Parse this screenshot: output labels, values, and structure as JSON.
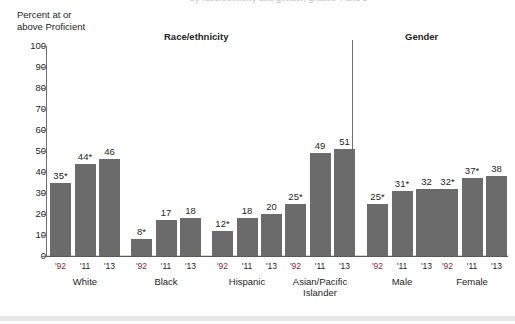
{
  "figure": {
    "clipped_title": "by race/ethnicity and gender, grades 4 and 8",
    "y_axis_caption": "Percent at or\nabove Proficient",
    "section_headers": {
      "race": "Race/ethnicity",
      "gender": "Gender"
    }
  },
  "chart_data": {
    "type": "bar",
    "title": "",
    "xlabel": "",
    "ylabel": "Percent at or above Proficient",
    "ylim": [
      0,
      100
    ],
    "ytick_values": [
      0,
      10,
      20,
      30,
      40,
      50,
      60,
      70,
      80,
      90,
      100
    ],
    "ytick_labels": [
      "0",
      "10",
      "20",
      "30",
      "40",
      "50",
      "60",
      "70",
      "80",
      "90",
      "100"
    ],
    "grid": false,
    "legend": "none",
    "series_label": "Percent at or above Proficient",
    "bar_color": "#6b6b6b",
    "base_year_label_color": "#8c2a33",
    "x_categories": [
      "'92",
      "'11",
      "'13"
    ],
    "groups": [
      {
        "name": "White",
        "section": "Race/ethnicity",
        "bars": [
          {
            "x": "'92",
            "value": 35,
            "label": "35*",
            "significant": true
          },
          {
            "x": "'11",
            "value": 44,
            "label": "44*",
            "significant": true
          },
          {
            "x": "'13",
            "value": 46,
            "label": "46",
            "significant": false
          }
        ]
      },
      {
        "name": "Black",
        "section": "Race/ethnicity",
        "bars": [
          {
            "x": "'92",
            "value": 8,
            "label": "8*",
            "significant": true
          },
          {
            "x": "'11",
            "value": 17,
            "label": "17",
            "significant": false
          },
          {
            "x": "'13",
            "value": 18,
            "label": "18",
            "significant": false
          }
        ]
      },
      {
        "name": "Hispanic",
        "section": "Race/ethnicity",
        "bars": [
          {
            "x": "'92",
            "value": 12,
            "label": "12*",
            "significant": true
          },
          {
            "x": "'11",
            "value": 18,
            "label": "18",
            "significant": false
          },
          {
            "x": "'13",
            "value": 20,
            "label": "20",
            "significant": false
          }
        ]
      },
      {
        "name": "Asian/Pacific\nIslander",
        "section": "Race/ethnicity",
        "bars": [
          {
            "x": "'92",
            "value": 25,
            "label": "25*",
            "significant": true
          },
          {
            "x": "'11",
            "value": 49,
            "label": "49",
            "significant": false
          },
          {
            "x": "'13",
            "value": 51,
            "label": "51",
            "significant": false
          }
        ]
      },
      {
        "name": "Male",
        "section": "Gender",
        "bars": [
          {
            "x": "'92",
            "value": 25,
            "label": "25*",
            "significant": true
          },
          {
            "x": "'11",
            "value": 31,
            "label": "31*",
            "significant": true
          },
          {
            "x": "'13",
            "value": 32,
            "label": "32",
            "significant": false
          }
        ]
      },
      {
        "name": "Female",
        "section": "Gender",
        "bars": [
          {
            "x": "'92",
            "value": 32,
            "label": "32*",
            "significant": true
          },
          {
            "x": "'11",
            "value": 37,
            "label": "37*",
            "significant": true
          },
          {
            "x": "'13",
            "value": 38,
            "label": "38",
            "significant": false
          }
        ]
      }
    ]
  }
}
